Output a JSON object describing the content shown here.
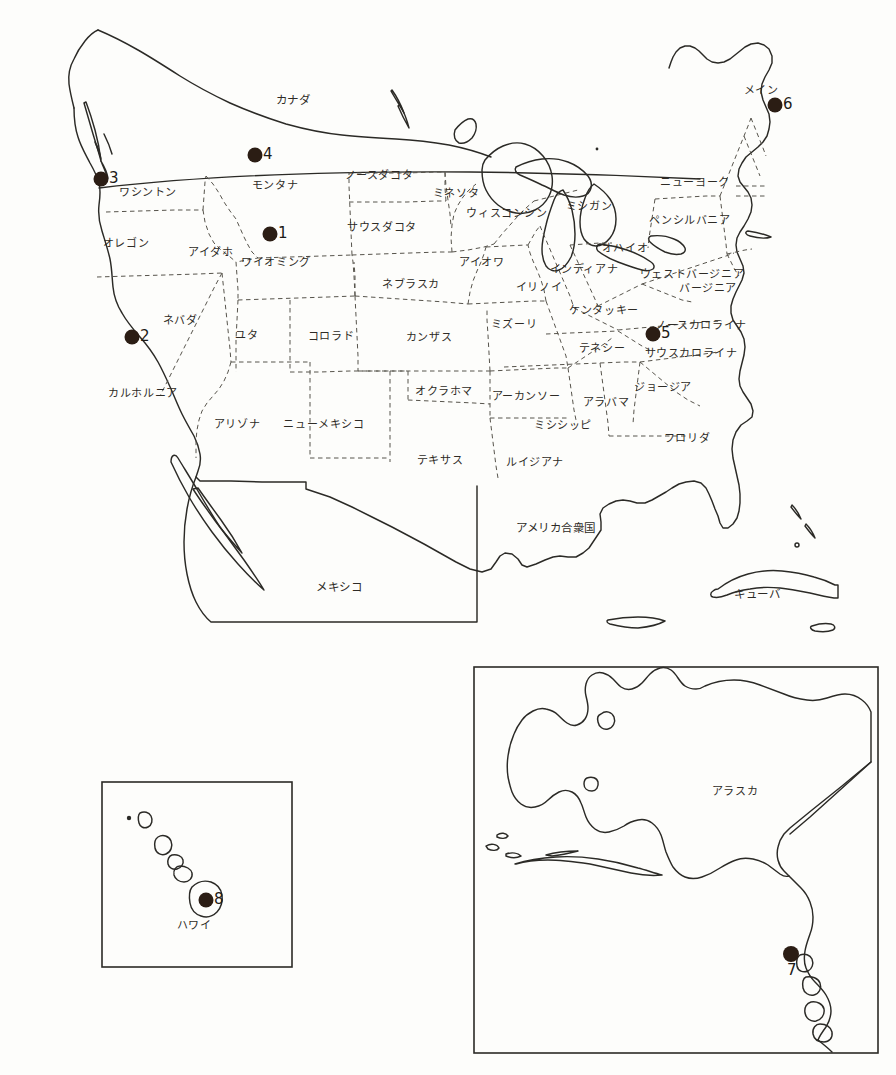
{
  "figure": {
    "type": "reference-map",
    "title": "",
    "caption": "",
    "background_color": "#fdfdfb",
    "line_color": "#2b2a26",
    "dash_color": "#57544c",
    "marker_color": "#2b1d14"
  },
  "main_map": {
    "name": "united-states-main-map",
    "country_labels": [
      {
        "text": "カナダ",
        "x": 293,
        "y": 101
      },
      {
        "text": "アメリカ合衆国",
        "x": 556,
        "y": 529
      },
      {
        "text": "メキシコ",
        "x": 339,
        "y": 588
      },
      {
        "text": "キューバ",
        "x": 757,
        "y": 595
      }
    ],
    "state_labels": [
      {
        "text": "ワシントン",
        "x": 148,
        "y": 192
      },
      {
        "text": "オレゴン",
        "x": 126,
        "y": 243
      },
      {
        "text": "アイダホ",
        "x": 211,
        "y": 252
      },
      {
        "text": "モンタナ",
        "x": 275,
        "y": 185
      },
      {
        "text": "ノースダコタ",
        "x": 379,
        "y": 175
      },
      {
        "text": "ミネソタ",
        "x": 456,
        "y": 193
      },
      {
        "text": "ワイオミング",
        "x": 276,
        "y": 262
      },
      {
        "text": "サウスダコタ",
        "x": 382,
        "y": 227
      },
      {
        "text": "ウィスコンシン",
        "x": 507,
        "y": 213
      },
      {
        "text": "ミシガン",
        "x": 589,
        "y": 206
      },
      {
        "text": "ネバダ",
        "x": 180,
        "y": 320
      },
      {
        "text": "ユタ",
        "x": 247,
        "y": 335
      },
      {
        "text": "コロラド",
        "x": 331,
        "y": 336
      },
      {
        "text": "ネブラスカ",
        "x": 411,
        "y": 284
      },
      {
        "text": "アイオワ",
        "x": 482,
        "y": 262
      },
      {
        "text": "イリノイ",
        "x": 539,
        "y": 287
      },
      {
        "text": "インディアナ",
        "x": 584,
        "y": 269
      },
      {
        "text": "オハイオ",
        "x": 625,
        "y": 248
      },
      {
        "text": "ニューヨーク",
        "x": 695,
        "y": 182
      },
      {
        "text": "ペンシルバニア",
        "x": 690,
        "y": 220
      },
      {
        "text": "メイン",
        "x": 761,
        "y": 90
      },
      {
        "text": "カルホルニア",
        "x": 143,
        "y": 393
      },
      {
        "text": "アリゾナ",
        "x": 237,
        "y": 424
      },
      {
        "text": "ニューメキシコ",
        "x": 324,
        "y": 424
      },
      {
        "text": "カンザス",
        "x": 429,
        "y": 337
      },
      {
        "text": "ミズーリ",
        "x": 514,
        "y": 324
      },
      {
        "text": "ケンタッキー",
        "x": 604,
        "y": 310
      },
      {
        "text": "ウェストバージニア",
        "x": 692,
        "y": 274
      },
      {
        "text": "バージニア",
        "x": 708,
        "y": 288
      },
      {
        "text": "ノースカロライナ",
        "x": 701,
        "y": 325
      },
      {
        "text": "テネシー",
        "x": 602,
        "y": 348
      },
      {
        "text": "サウスカロライナ",
        "x": 691,
        "y": 353
      },
      {
        "text": "オクラホマ",
        "x": 444,
        "y": 391
      },
      {
        "text": "アーカンソー",
        "x": 526,
        "y": 396
      },
      {
        "text": "アラバマ",
        "x": 606,
        "y": 402
      },
      {
        "text": "ジョージア",
        "x": 663,
        "y": 387
      },
      {
        "text": "ミシシッピ",
        "x": 563,
        "y": 425
      },
      {
        "text": "フロリダ",
        "x": 687,
        "y": 438
      },
      {
        "text": "テキサス",
        "x": 440,
        "y": 460
      },
      {
        "text": "ルイジアナ",
        "x": 535,
        "y": 462
      }
    ],
    "markers": [
      {
        "id": "1",
        "x": 270,
        "y": 234,
        "label_x": 278,
        "label_y": 226
      },
      {
        "id": "2",
        "x": 132,
        "y": 337,
        "label_x": 140,
        "label_y": 329
      },
      {
        "id": "3",
        "x": 101,
        "y": 179,
        "label_x": 109,
        "label_y": 171
      },
      {
        "id": "4",
        "x": 255,
        "y": 155,
        "label_x": 263,
        "label_y": 147
      },
      {
        "id": "5",
        "x": 653,
        "y": 334,
        "label_x": 661,
        "label_y": 326
      },
      {
        "id": "6",
        "x": 775,
        "y": 105,
        "label_x": 783,
        "label_y": 97
      }
    ]
  },
  "alaska_inset": {
    "name": "alaska-inset",
    "frame": {
      "x": 474,
      "y": 667,
      "width": 404,
      "height": 386
    },
    "labels": [
      {
        "text": "アラスカ",
        "x": 735,
        "y": 791
      }
    ],
    "markers": [
      {
        "id": "7",
        "x": 791,
        "y": 954,
        "label_x": 787,
        "label_y": 963
      }
    ]
  },
  "hawaii_inset": {
    "name": "hawaii-inset",
    "frame": {
      "x": 102,
      "y": 782,
      "width": 190,
      "height": 185
    },
    "labels": [
      {
        "text": "ハワイ",
        "x": 194,
        "y": 925
      }
    ],
    "markers": [
      {
        "id": "8",
        "x": 206,
        "y": 900,
        "label_x": 214,
        "label_y": 892
      }
    ]
  }
}
